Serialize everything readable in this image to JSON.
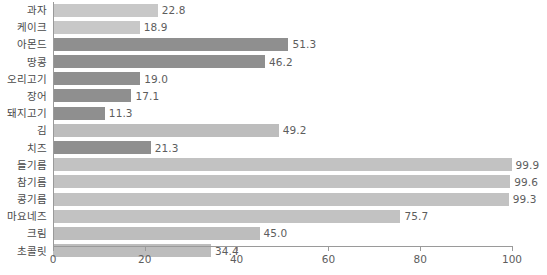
{
  "chart_data": {
    "type": "bar",
    "orientation": "horizontal",
    "title": "",
    "xlabel": "",
    "ylabel": "",
    "xlim": [
      0,
      100
    ],
    "xticks": [
      0,
      20,
      40,
      60,
      80,
      100
    ],
    "grid": false,
    "legend": "none",
    "categories": [
      "과자",
      "케이크",
      "아몬드",
      "땅콩",
      "오리고기",
      "장어",
      "돼지고기",
      "김",
      "치즈",
      "들기름",
      "참기름",
      "콩기름",
      "마요네즈",
      "크림",
      "초콜릿"
    ],
    "values": [
      22.8,
      18.9,
      51.3,
      46.2,
      19.0,
      17.1,
      11.3,
      49.2,
      21.3,
      99.9,
      99.6,
      99.3,
      75.7,
      45.0,
      34.4
    ],
    "value_labels": [
      "22.8",
      "18.9",
      "51.3",
      "46.2",
      "19.0",
      "17.1",
      "11.3",
      "49.2",
      "21.3",
      "99.9",
      "99.6",
      "99.3",
      "75.7",
      "45.0",
      "34.4"
    ],
    "bar_shades": [
      "shade-light",
      "shade-light",
      "shade-dark",
      "shade-dark",
      "shade-dark",
      "shade-dark",
      "shade-dark",
      "shade-mid",
      "shade-dark",
      "shade-oil",
      "shade-oil",
      "shade-oil",
      "shade-oil",
      "shade-mid",
      "shade-mid"
    ],
    "colors": {
      "light": "#c8c8c8",
      "mid": "#bdbdbd",
      "dark": "#8f8f8f",
      "oil": "#c2c2c2",
      "axis": "#9a9a9a",
      "text": "#4a4a4a",
      "value_text": "#5d5d5d",
      "background": "#ffffff"
    }
  }
}
